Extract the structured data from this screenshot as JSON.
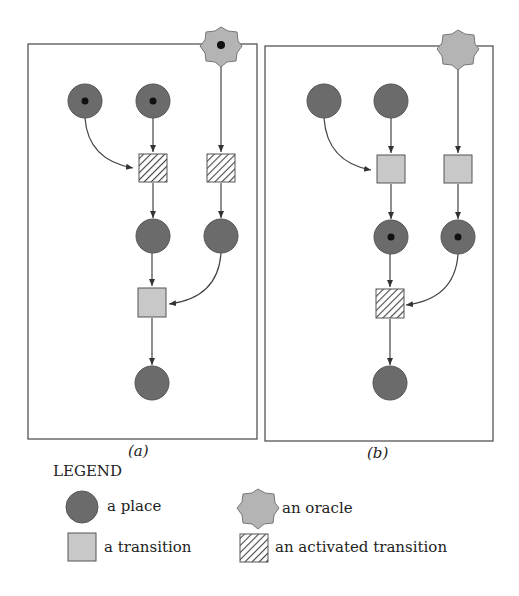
{
  "colors": {
    "place_fill": "#6b6b6b",
    "transition_fill": "#c8c8c8",
    "oracle_fill": "#b4b4b4",
    "stroke": "#555555",
    "token": "#111111",
    "hatch": "#444444"
  },
  "panels": [
    {
      "caption": "(a)",
      "oracle_has_token": true,
      "places_with_tokens": [
        "p1",
        "p2"
      ],
      "activated_transitions": [
        "t1",
        "t2"
      ]
    },
    {
      "caption": "(b)",
      "oracle_has_token": false,
      "places_with_tokens": [
        "p3",
        "p4"
      ],
      "activated_transitions": [
        "t3"
      ]
    }
  ],
  "legend": {
    "title": "LEGEND",
    "items": [
      {
        "shape": "place",
        "label": "a place"
      },
      {
        "shape": "oracle",
        "label": "an oracle"
      },
      {
        "shape": "transition",
        "label": "a transition"
      },
      {
        "shape": "activated-transition",
        "label": "an activated transition"
      }
    ]
  }
}
